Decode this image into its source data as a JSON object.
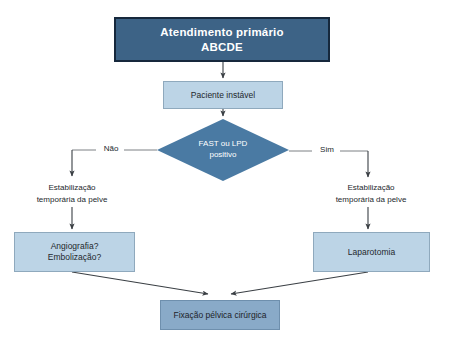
{
  "diagram": {
    "colors": {
      "dark_node_fill": "#3d6386",
      "dark_node_border": "#16283c",
      "light_node_fill": "#bcd4e6",
      "light_node_border": "#8fa9bd",
      "diamond_fill": "#4a7aa3",
      "terminal_fill": "#89aac8",
      "terminal_border": "#6e8fad",
      "connector": "#3a3f44",
      "text_dark": "#23282d",
      "text_light": "#ffffff",
      "background": "#ffffff"
    },
    "nodes": {
      "primary_care": {
        "line1": "Atendimento primário",
        "line2": "ABCDE"
      },
      "unstable_patient": {
        "label": "Paciente instável"
      },
      "decision": {
        "line1": "FAST ou LPD",
        "line2": "positivo"
      },
      "stabilization_left": {
        "line1": "Estabilização",
        "line2": "temporária da pelve"
      },
      "stabilization_right": {
        "line1": "Estabilização",
        "line2": "temporária da pelve"
      },
      "angiography": {
        "line1": "Angiografia?",
        "line2": "Embolização?"
      },
      "laparotomy": {
        "label": "Laparotomia"
      },
      "surgical_fixation": {
        "label": "Fixação pélvica cirúrgica"
      }
    },
    "branches": {
      "no_label": "Não",
      "yes_label": "Sim"
    }
  }
}
